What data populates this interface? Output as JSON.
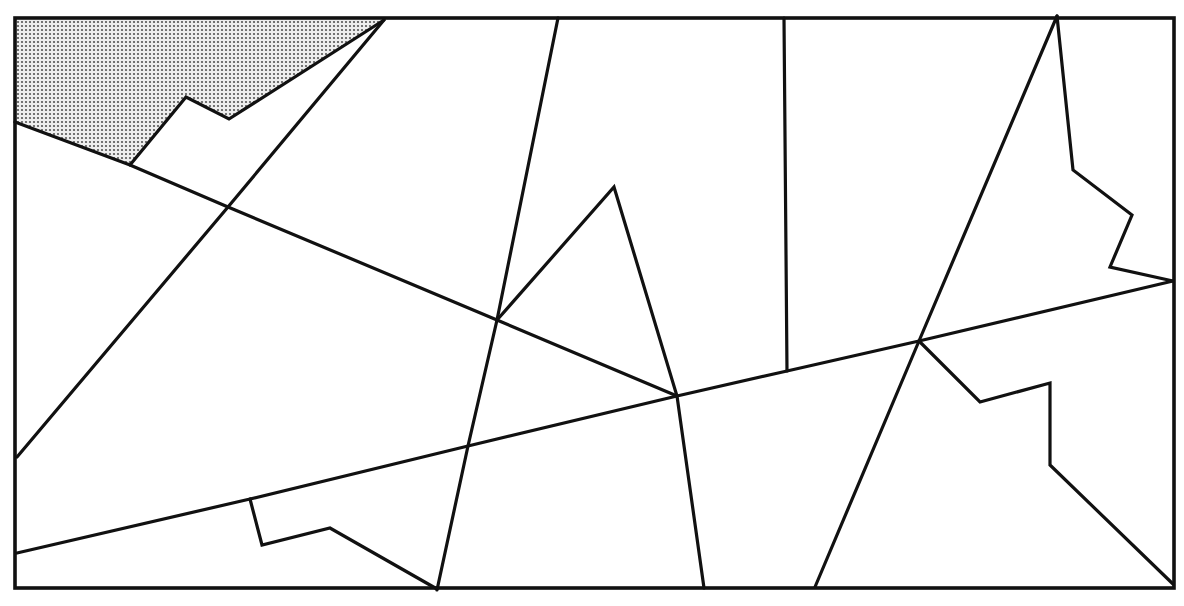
{
  "diagram": {
    "type": "line-arrangement-with-shaded-region",
    "colors": {
      "background": "#ffffff",
      "stroke": "#111111",
      "shade_dot": "#555555",
      "shade_bg": "#eeeeee"
    },
    "frame": {
      "x1": 15,
      "y1": 18,
      "x2": 1174,
      "y2": 588
    },
    "shaded_region": {
      "points": [
        [
          15,
          20
        ],
        [
          384,
          20
        ],
        [
          229,
          119
        ],
        [
          186,
          97
        ],
        [
          130,
          165
        ],
        [
          15,
          122
        ]
      ]
    },
    "lines": [
      {
        "id": "line-a",
        "points": [
          [
            15,
            122
          ],
          [
            130,
            165
          ],
          [
            228,
            207
          ],
          [
            497,
            320
          ],
          [
            677,
            396
          ]
        ]
      },
      {
        "id": "line-b",
        "points": [
          [
            17,
            457
          ],
          [
            228,
            207
          ],
          [
            384,
            20
          ]
        ]
      },
      {
        "id": "line-c",
        "points": [
          [
            17,
            553
          ],
          [
            250,
            499
          ],
          [
            468,
            446
          ],
          [
            677,
            396
          ],
          [
            787,
            371
          ],
          [
            919,
            341
          ],
          [
            1173,
            281
          ]
        ]
      },
      {
        "id": "line-d",
        "points": [
          [
            437,
            590
          ],
          [
            468,
            446
          ],
          [
            497,
            320
          ],
          [
            558,
            18
          ]
        ]
      },
      {
        "id": "line-e",
        "points": [
          [
            497,
            320
          ],
          [
            614,
            187
          ],
          [
            677,
            396
          ],
          [
            704,
            588
          ]
        ]
      },
      {
        "id": "line-f",
        "points": [
          [
            784,
            18
          ],
          [
            787,
            371
          ]
        ]
      },
      {
        "id": "line-g",
        "points": [
          [
            815,
            587
          ],
          [
            919,
            341
          ],
          [
            1057,
            16
          ]
        ]
      },
      {
        "id": "zigzag-top-right",
        "points": [
          [
            1057,
            16
          ],
          [
            1073,
            170
          ],
          [
            1132,
            215
          ],
          [
            1110,
            267
          ],
          [
            1173,
            281
          ]
        ]
      },
      {
        "id": "zigzag-bottom-right",
        "points": [
          [
            919,
            341
          ],
          [
            980,
            402
          ],
          [
            1050,
            383
          ],
          [
            1050,
            465
          ],
          [
            1173,
            584
          ]
        ]
      },
      {
        "id": "zigzag-bottom-left",
        "points": [
          [
            250,
            499
          ],
          [
            262,
            545
          ],
          [
            330,
            528
          ],
          [
            437,
            589
          ]
        ]
      },
      {
        "id": "zigzag-shaded-edge",
        "points": [
          [
            384,
            20
          ],
          [
            229,
            119
          ],
          [
            186,
            97
          ],
          [
            130,
            165
          ]
        ]
      }
    ]
  }
}
